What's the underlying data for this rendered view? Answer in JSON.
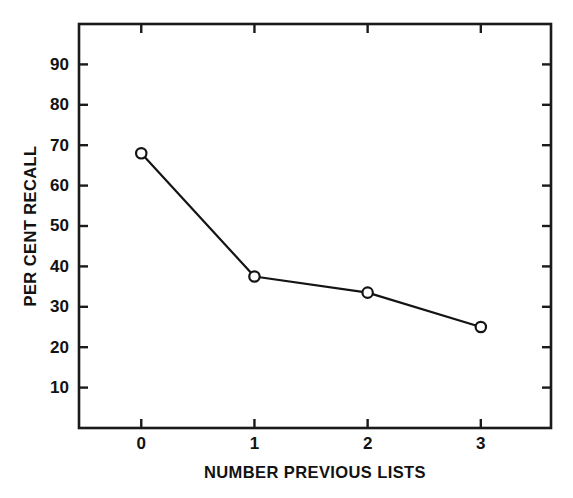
{
  "chart_data": {
    "type": "line",
    "title": "",
    "subtitle": "",
    "xlabel": "NUMBER PREVIOUS LISTS",
    "ylabel": "PER CENT RECALL",
    "x": [
      0,
      1,
      2,
      3
    ],
    "values": [
      68,
      37.5,
      33.5,
      25
    ],
    "series": [
      {
        "name": "Per cent recall",
        "values": [
          68,
          37.5,
          33.5,
          25
        ],
        "marker": "open-circle",
        "line_color": "#141414",
        "marker_fill": "#ffffff"
      }
    ],
    "xlim": [
      -0.55,
      3.62
    ],
    "ylim": [
      0,
      100
    ],
    "xticks": [
      0,
      1,
      2,
      3
    ],
    "xtick_labels": [
      "0",
      "1",
      "2",
      "3"
    ],
    "yticks": [
      10,
      20,
      30,
      40,
      50,
      60,
      70,
      80,
      90
    ],
    "ytick_labels": [
      "10",
      "20",
      "30",
      "40",
      "50",
      "60",
      "70",
      "80",
      "90"
    ],
    "grid": false,
    "legend": false,
    "legend_position": "none",
    "tick_direction": "in",
    "frame": "full-box",
    "background_color": "#ffffff",
    "axis_color": "#1a1a1a"
  }
}
